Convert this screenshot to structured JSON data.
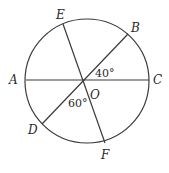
{
  "diagram": {
    "type": "circle-with-diameters",
    "circle": {
      "cx": 87,
      "cy": 81,
      "r": 62,
      "stroke": "#3a3a3a"
    },
    "center": {
      "label": "O",
      "x": 83,
      "y": 80
    },
    "points": {
      "A": {
        "label": "A",
        "x": 26,
        "y": 80
      },
      "C": {
        "label": "C",
        "x": 149,
        "y": 80
      },
      "B": {
        "label": "B",
        "x": 128,
        "y": 34
      },
      "D": {
        "label": "D",
        "x": 42,
        "y": 124
      },
      "E": {
        "label": "E",
        "x": 63,
        "y": 24
      },
      "F": {
        "label": "F",
        "x": 105,
        "y": 143
      }
    },
    "segments": [
      "AC",
      "BD",
      "EF"
    ],
    "angles": [
      {
        "label": "40°",
        "between": "BOC"
      },
      {
        "label": "60°",
        "between": "DOF"
      }
    ]
  }
}
